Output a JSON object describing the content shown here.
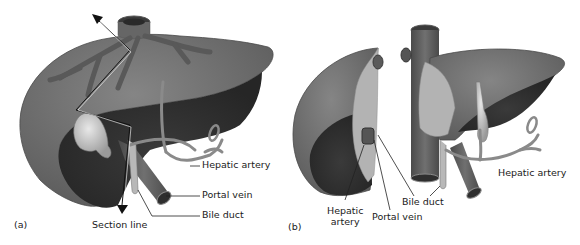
{
  "figure": {
    "panels": [
      {
        "id": "a",
        "tag": "(a)",
        "labels": {
          "hepatic_artery": "Hepatic artery",
          "portal_vein": "Portal vein",
          "bile_duct": "Bile duct",
          "section_line": "Section line"
        }
      },
      {
        "id": "b",
        "tag": "(b)",
        "labels": {
          "hepatic_artery_left_line1": "Hepatic",
          "hepatic_artery_left_line2": "artery",
          "portal_vein": "Portal vein",
          "bile_duct": "Bile duct",
          "hepatic_artery_right": "Hepatic artery"
        }
      }
    ],
    "colors": {
      "liver_surface": "#6e6e6e",
      "liver_underside": "#333333",
      "cut_surface": "#b3b3b3",
      "vessel": "#5a5a5a",
      "gallbladder": "#c8c8c8",
      "leader_line": "#222222",
      "background": "#ffffff"
    }
  }
}
